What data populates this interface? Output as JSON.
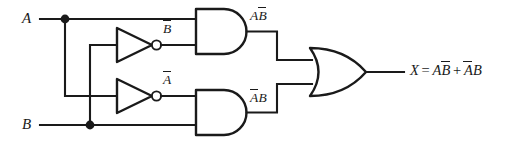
{
  "diagram": {
    "ink_color": "#1a1a1a",
    "background_color": "#ffffff",
    "inputs": [
      {
        "name": "input-a",
        "label": "A"
      },
      {
        "name": "input-b",
        "label": "B"
      }
    ],
    "signals": {
      "not_b": {
        "base": "B",
        "overbar": true
      },
      "not_a": {
        "base": "A",
        "overbar": true
      },
      "and_top": {
        "first": "A",
        "second": "B",
        "second_overbar": true
      },
      "and_bottom": {
        "first": "A",
        "first_overbar": true,
        "second": "B"
      }
    },
    "output": {
      "name": "output-expression",
      "lhs": "X",
      "equals": "=",
      "term1_plain": "A",
      "term1_bar": "B",
      "plus": "+",
      "term2_bar": "A",
      "term2_plain": "B"
    },
    "gates": [
      {
        "name": "inverter-top",
        "type": "NOT",
        "output_label": "B-bar"
      },
      {
        "name": "inverter-bottom",
        "type": "NOT",
        "output_label": "A-bar"
      },
      {
        "name": "and-gate-top",
        "type": "AND",
        "output_label": "A B-bar"
      },
      {
        "name": "and-gate-bottom",
        "type": "AND",
        "output_label": "A-bar B"
      },
      {
        "name": "or-gate",
        "type": "OR",
        "output_label": "X"
      }
    ]
  }
}
